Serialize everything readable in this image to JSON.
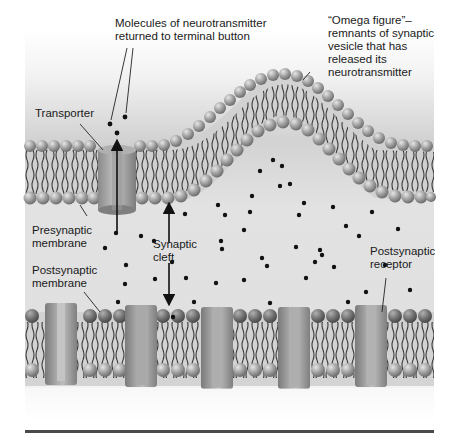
{
  "figure": {
    "colors": {
      "background_top": "#ffffff",
      "background_band": "#d6d6d6",
      "cleft": "#e4e4e4",
      "lipid_head": "#9a9a9a",
      "lipid_head_highlight": "#d8d8d8",
      "lipid_tail": "#3a3a3a",
      "protein": "#8f8f8f",
      "protein_light": "#b5b5b5",
      "molecule": "#111111",
      "divider": "#4a4a4a"
    },
    "labels": {
      "molecules_returned": "Molecules of neurotransmitter\nreturned to terminal button",
      "omega_figure": "“Omega figure”–\nremnants of synaptic\nvesicle that has\nreleased its\nneurotransmitter",
      "transporter": "Transporter",
      "presynaptic_membrane": "Presynaptic\nmembrane",
      "synaptic_cleft": "Synaptic\ncleft",
      "postsynaptic_membrane": "Postsynaptic\nmembrane",
      "postsynaptic_receptor": "Postsynaptic\nreceptor"
    }
  }
}
